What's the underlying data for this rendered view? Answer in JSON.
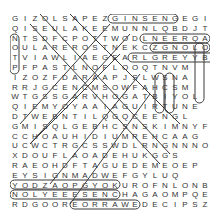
{
  "puzzle": {
    "type": "word-search",
    "columns": 20,
    "rows": 20,
    "grid": [
      "GIZOLSAPEZGINSENGEGI",
      "QISEULAKEEMUNNLQBDJTZ",
      "NTSDFCPOTTWODLNEERQA",
      "OULAREROSTNEKCZGNOLOO",
      "TVIAWLIAEGEARLGREYYB",
      "PFPASTLNOFLOOQTNVM",
      "IZOZFDARAAPJSLWSNA",
      "RRJGCENCMSOWFAHCSM",
      "WTGSSGARVHOGATBIYOL",
      "QIEMYOYAAIAGUIRTUNE",
      "DTWEBNTILQGQCEENGL",
      "GMISQLGEBHCSNSKIMNYF",
      "CCHOAUHIDIUMREHCAAG",
      "UCWCTRGCSSWDLRNGNNNO",
      "XDOUFLAOADEHUKGGS",
      "RAEOHDFTAGUEDEMEOEP",
      "EYSIGNMADWEFGYLUQ",
      "YODZAOPGYOKUROFNLONB",
      "NOLYEEESENCHAGAOMPQE",
      "RDGOOREORRAWEDECIPSZF"
    ],
    "highlight_color": "#3a3a3a",
    "letter_color": "#333333",
    "found_words_visible": [
      "GINSENG",
      "EARL GREY",
      "OOLONG",
      "DECIPS",
      "CHAGA",
      "GREEN",
      "LEMON"
    ]
  }
}
